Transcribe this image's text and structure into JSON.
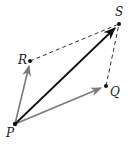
{
  "diagram": {
    "type": "vector-parallelogram",
    "points": {
      "P": {
        "label": "P",
        "x": 15,
        "y": 124,
        "label_x": 6,
        "label_y": 137
      },
      "Q": {
        "label": "Q",
        "x": 106,
        "y": 86,
        "label_x": 110,
        "label_y": 96
      },
      "R": {
        "label": "R",
        "x": 30,
        "y": 61,
        "label_x": 18,
        "label_y": 64
      },
      "S": {
        "label": "S",
        "x": 119,
        "y": 24,
        "label_x": 115,
        "label_y": 16
      }
    },
    "vectors": [
      {
        "from": "P",
        "to": "R",
        "style": "solid-arrow",
        "color": "#7a7a7a"
      },
      {
        "from": "P",
        "to": "Q",
        "style": "solid-arrow",
        "color": "#7a7a7a"
      },
      {
        "from": "P",
        "to": "S",
        "style": "solid-arrow",
        "color": "#111111"
      }
    ],
    "dashed_edges": [
      {
        "from": "R",
        "to": "S",
        "color": "#333333"
      },
      {
        "from": "Q",
        "to": "S",
        "color": "#333333"
      }
    ]
  }
}
